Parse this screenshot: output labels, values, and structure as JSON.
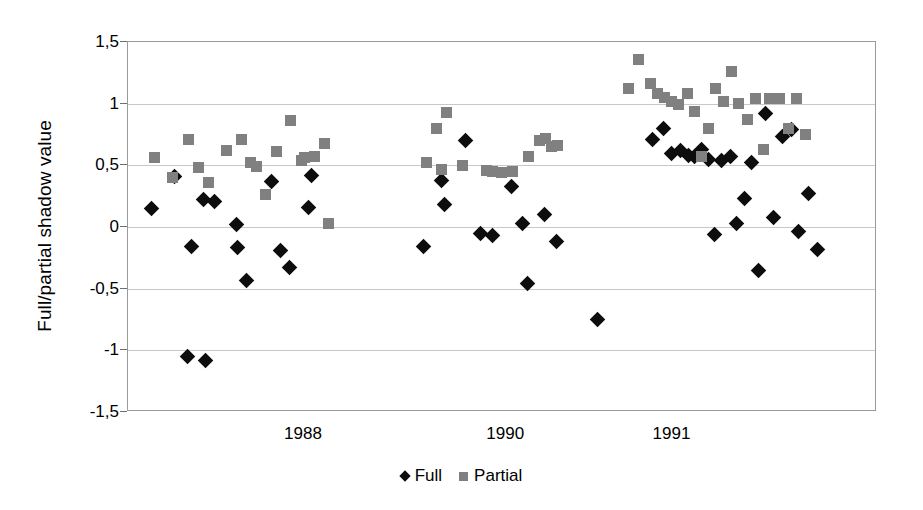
{
  "chart_data": {
    "type": "scatter",
    "title": "",
    "xlabel": "",
    "ylabel": "Full/partial shadow value",
    "ylim": [
      -1.5,
      1.5
    ],
    "yticks": [
      1.5,
      1.0,
      0.5,
      0.0,
      -0.5,
      -1.0,
      -1.5
    ],
    "ytick_labels": [
      "1,5",
      "1",
      "0,5",
      "0",
      "-0,5",
      "-1",
      "-1,5"
    ],
    "xtick_labels": [
      "1988",
      "1990",
      "1991"
    ],
    "xtick_positions": [
      0.235,
      0.505,
      0.727
    ],
    "grid": "horizontal",
    "legend_position": "bottom-center",
    "decimal_separator": ",",
    "colors": {
      "full": "#0d0d0d",
      "partial": "#808080",
      "grid": "#c8c8c8",
      "frame": "#9a9a9a",
      "background": "#ffffff"
    },
    "series": [
      {
        "name": "Full",
        "marker": "diamond",
        "color": "#0d0d0d",
        "points": [
          [
            0.032,
            0.15
          ],
          [
            0.062,
            0.41
          ],
          [
            0.101,
            0.22
          ],
          [
            0.115,
            0.21
          ],
          [
            0.085,
            -0.16
          ],
          [
            0.145,
            0.02
          ],
          [
            0.146,
            -0.17
          ],
          [
            0.158,
            -0.43
          ],
          [
            0.191,
            0.37
          ],
          [
            0.203,
            -0.19
          ],
          [
            0.215,
            -0.33
          ],
          [
            0.245,
            0.42
          ],
          [
            0.241,
            0.16
          ],
          [
            0.079,
            -1.05
          ],
          [
            0.103,
            -1.08
          ],
          [
            0.395,
            -0.16
          ],
          [
            0.418,
            0.38
          ],
          [
            0.423,
            0.18
          ],
          [
            0.451,
            0.7
          ],
          [
            0.471,
            -0.05
          ],
          [
            0.487,
            -0.07
          ],
          [
            0.512,
            0.33
          ],
          [
            0.527,
            0.03
          ],
          [
            0.533,
            -0.46
          ],
          [
            0.556,
            0.1
          ],
          [
            0.572,
            -0.12
          ],
          [
            0.627,
            -0.75
          ],
          [
            0.7,
            0.71
          ],
          [
            0.715,
            0.8
          ],
          [
            0.726,
            0.6
          ],
          [
            0.737,
            0.62
          ],
          [
            0.748,
            0.58
          ],
          [
            0.757,
            0.57
          ],
          [
            0.766,
            0.63
          ],
          [
            0.775,
            0.55
          ],
          [
            0.783,
            -0.06
          ],
          [
            0.793,
            0.54
          ],
          [
            0.805,
            0.57
          ],
          [
            0.812,
            0.03
          ],
          [
            0.823,
            0.23
          ],
          [
            0.833,
            0.52
          ],
          [
            0.842,
            -0.35
          ],
          [
            0.851,
            0.92
          ],
          [
            0.862,
            0.08
          ],
          [
            0.874,
            0.73
          ],
          [
            0.886,
            0.79
          ],
          [
            0.895,
            -0.04
          ],
          [
            0.908,
            0.27
          ],
          [
            0.921,
            -0.18
          ]
        ]
      },
      {
        "name": "Partial",
        "marker": "square",
        "color": "#808080",
        "points": [
          [
            0.035,
            0.56
          ],
          [
            0.059,
            0.4
          ],
          [
            0.081,
            0.71
          ],
          [
            0.094,
            0.48
          ],
          [
            0.107,
            0.36
          ],
          [
            0.132,
            0.62
          ],
          [
            0.151,
            0.71
          ],
          [
            0.164,
            0.52
          ],
          [
            0.171,
            0.49
          ],
          [
            0.183,
            0.26
          ],
          [
            0.198,
            0.61
          ],
          [
            0.217,
            0.86
          ],
          [
            0.231,
            0.54
          ],
          [
            0.236,
            0.56
          ],
          [
            0.249,
            0.57
          ],
          [
            0.262,
            0.68
          ],
          [
            0.268,
            0.03
          ],
          [
            0.399,
            0.52
          ],
          [
            0.412,
            0.8
          ],
          [
            0.425,
            0.93
          ],
          [
            0.418,
            0.47
          ],
          [
            0.447,
            0.5
          ],
          [
            0.478,
            0.46
          ],
          [
            0.486,
            0.45
          ],
          [
            0.498,
            0.44
          ],
          [
            0.513,
            0.45
          ],
          [
            0.535,
            0.57
          ],
          [
            0.549,
            0.7
          ],
          [
            0.558,
            0.72
          ],
          [
            0.566,
            0.65
          ],
          [
            0.574,
            0.66
          ],
          [
            0.668,
            1.12
          ],
          [
            0.681,
            1.36
          ],
          [
            0.697,
            1.16
          ],
          [
            0.707,
            1.08
          ],
          [
            0.716,
            1.05
          ],
          [
            0.725,
            1.02
          ],
          [
            0.735,
            0.99
          ],
          [
            0.747,
            1.08
          ],
          [
            0.757,
            0.94
          ],
          [
            0.766,
            0.57
          ],
          [
            0.775,
            0.8
          ],
          [
            0.785,
            1.12
          ],
          [
            0.795,
            1.02
          ],
          [
            0.806,
            1.26
          ],
          [
            0.815,
            1.0
          ],
          [
            0.827,
            0.87
          ],
          [
            0.838,
            1.04
          ],
          [
            0.848,
            0.63
          ],
          [
            0.857,
            1.04
          ],
          [
            0.87,
            1.04
          ],
          [
            0.882,
            0.8
          ],
          [
            0.893,
            1.04
          ],
          [
            0.905,
            0.75
          ]
        ]
      }
    ]
  },
  "legend": {
    "items": [
      {
        "label": "Full",
        "marker": "diamond"
      },
      {
        "label": "Partial",
        "marker": "square"
      }
    ]
  }
}
